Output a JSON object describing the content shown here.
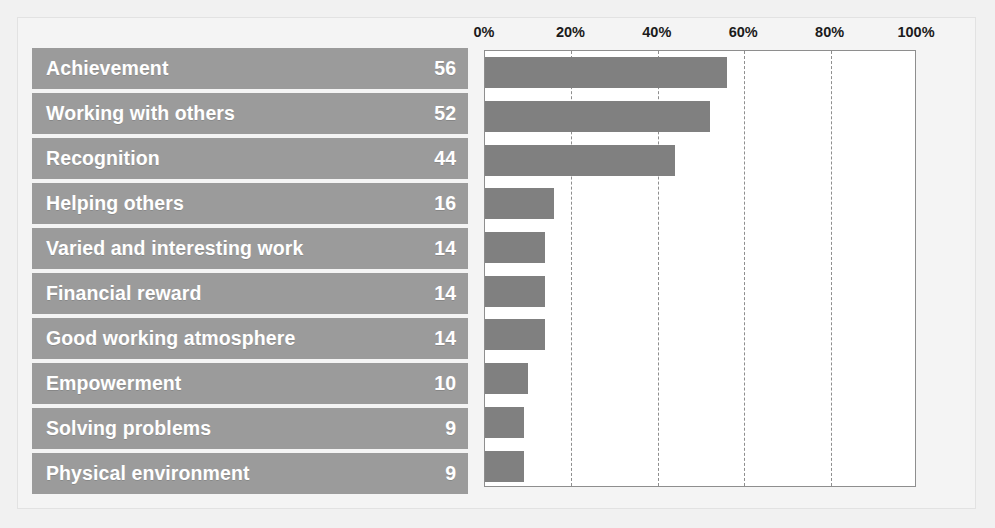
{
  "chart_data": {
    "type": "bar",
    "orientation": "horizontal",
    "title": "",
    "xlabel": "",
    "ylabel": "",
    "xlim": [
      0,
      100
    ],
    "grid": true,
    "legend": null,
    "value_suffix": "%",
    "bar_color": "#808080",
    "label_bar_color": "#9b9b9b",
    "label_text_color": "#ffffff",
    "axis_text_color": "#1b1b1b",
    "plot_background": "#ffffff",
    "figure_background": "#f1f1f1",
    "tick_labels": [
      "0%",
      "20%",
      "40%",
      "60%",
      "80%",
      "100%"
    ],
    "tick_values": [
      0,
      20,
      40,
      60,
      80,
      100
    ],
    "categories": [
      "Achievement",
      "Working with others",
      "Recognition",
      "Helping others",
      "Varied and interesting work",
      "Financial reward",
      "Good working atmosphere",
      "Empowerment",
      "Solving problems",
      "Physical environment"
    ],
    "values": [
      56,
      52,
      44,
      16,
      14,
      14,
      14,
      10,
      9,
      9
    ],
    "rows": [
      {
        "label": "Achievement",
        "value": 56
      },
      {
        "label": "Working with others",
        "value": 52
      },
      {
        "label": "Recognition",
        "value": 44
      },
      {
        "label": "Helping others",
        "value": 16
      },
      {
        "label": "Varied and interesting work",
        "value": 14
      },
      {
        "label": "Financial reward",
        "value": 14
      },
      {
        "label": "Good working atmosphere",
        "value": 14
      },
      {
        "label": "Empowerment",
        "value": 10
      },
      {
        "label": "Solving problems",
        "value": 9
      },
      {
        "label": "Physical environment",
        "value": 9
      }
    ]
  }
}
